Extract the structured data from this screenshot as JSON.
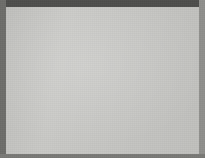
{
  "scan": {
    "width": 205,
    "height": 158,
    "board_color": "#c9c9c6",
    "frame_color": "#4e4e4c",
    "line_color": "#45453f",
    "stone_color": "#121210"
  },
  "board": {
    "label": "go-board",
    "origin_x": 18,
    "origin_y": 16,
    "cell_size": 18.2,
    "columns": 10,
    "rows": 8,
    "vertical_lines_x": [
      18,
      36,
      54,
      72,
      90,
      109,
      127,
      145,
      163,
      178
    ],
    "horizontal_lines_y": [
      16,
      34,
      52,
      71,
      89,
      107,
      126,
      144
    ],
    "edge_lines": {
      "top_y": 16,
      "bottom_y": 144,
      "left_x": 18,
      "right_x": 178
    }
  },
  "hoshi_points": [
    {
      "name": "star-point-left",
      "x": 18,
      "y": 71
    },
    {
      "name": "star-point-right",
      "x": 131,
      "y": 71
    }
  ],
  "stones": [
    {
      "name": "stone-top-left",
      "color": "black",
      "x": 90,
      "y": 71,
      "radius": 11.5
    },
    {
      "name": "stone-top-right",
      "color": "black",
      "x": 109,
      "y": 71,
      "radius": 11.5
    },
    {
      "name": "stone-middle-left",
      "color": "black",
      "x": 75,
      "y": 89,
      "radius": 11.5
    },
    {
      "name": "stone-middle-right",
      "color": "black",
      "x": 128,
      "y": 89,
      "radius": 11.5
    },
    {
      "name": "stone-bottom-left",
      "color": "black",
      "x": 90,
      "y": 107,
      "radius": 11.5
    },
    {
      "name": "stone-bottom-right",
      "color": "black",
      "x": 109,
      "y": 107,
      "radius": 11.5
    }
  ]
}
